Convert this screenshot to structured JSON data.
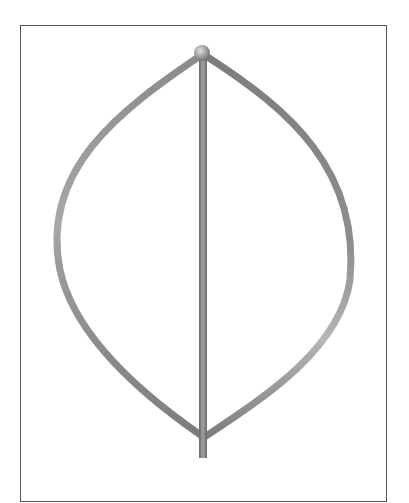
{
  "figure": {
    "frame": {
      "x": 20,
      "y": 25,
      "width": 367,
      "height": 460
    },
    "colors": {
      "background": "#ffffff",
      "frame_border": "#555555",
      "blade": "#8a8a8a",
      "blade_highlight": "#bdbdbd",
      "shaft": "#7a7a7a",
      "hub": "#9a9a9a"
    },
    "components": [
      {
        "name": "top-hub",
        "shape": "sphere",
        "cx": 202,
        "cy": 52,
        "r": 8
      },
      {
        "name": "central-shaft",
        "x1": 203,
        "y1": 55,
        "x2": 205,
        "y2": 458
      },
      {
        "name": "left-blade",
        "from": [
          200,
          55
        ],
        "to": [
          203,
          435
        ],
        "max_extent_x": 58
      },
      {
        "name": "right-blade",
        "from": [
          205,
          55
        ],
        "to": [
          205,
          435
        ],
        "max_extent_x": 352
      }
    ]
  }
}
